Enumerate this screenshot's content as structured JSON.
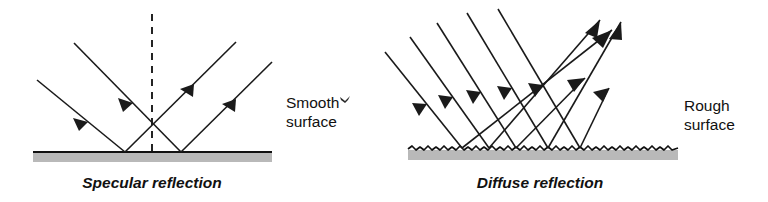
{
  "figure": {
    "background_color": "#ffffff",
    "ink_color": "#1a1a1a",
    "surface_fill_color": "#b9b9b9",
    "width": 768,
    "height": 202
  },
  "labels": {
    "smooth_line1": "Smooth",
    "smooth_line2": "surface",
    "rough_line1": "Rough",
    "rough_line2": "surface",
    "caption_left": "Specular reflection",
    "caption_right": "Diffuse reflection"
  },
  "panels": [
    {
      "id": "specular",
      "name": "specular-reflection-panel",
      "caption": "Specular reflection",
      "surface_label": "Smooth surface",
      "surface_type": "smooth",
      "surface": {
        "x1": 33,
        "x2": 272,
        "y": 152,
        "thickness": 9
      },
      "normal": {
        "x": 152,
        "y_top": 14,
        "y_bottom": 152,
        "style": "dashed"
      },
      "incident_rays": [
        {
          "x1": 74,
          "y1": 43,
          "x2": 181,
          "y2": 152,
          "arrow_t": 0.55
        },
        {
          "x1": 37,
          "y1": 80,
          "x2": 125,
          "y2": 152,
          "arrow_t": 0.55
        }
      ],
      "reflected_rays": [
        {
          "x1": 125,
          "y1": 152,
          "x2": 236,
          "y2": 42,
          "arrow_t": 0.55
        },
        {
          "x1": 181,
          "y1": 152,
          "x2": 272,
          "y2": 62,
          "arrow_t": 0.55
        }
      ],
      "crossing_point": {
        "x": 152,
        "y": 123
      }
    },
    {
      "id": "diffuse",
      "name": "diffuse-reflection-panel",
      "caption": "Diffuse reflection",
      "surface_label": "Rough surface",
      "surface_type": "rough",
      "surface": {
        "x1": 408,
        "x2": 678,
        "y": 149,
        "thickness": 9
      },
      "incident_rays": [
        {
          "x1": 410,
          "y1": 37,
          "x2": 489,
          "y2": 148,
          "arrow_t": 0.52
        },
        {
          "x1": 437,
          "y1": 23,
          "x2": 516,
          "y2": 148,
          "arrow_t": 0.52
        },
        {
          "x1": 467,
          "y1": 13,
          "x2": 548,
          "y2": 148,
          "arrow_t": 0.52
        },
        {
          "x1": 498,
          "y1": 9,
          "x2": 580,
          "y2": 148,
          "arrow_t": 0.52
        },
        {
          "x1": 385,
          "y1": 52,
          "x2": 462,
          "y2": 148,
          "arrow_t": 0.5
        }
      ],
      "reflected_rays": [
        {
          "x1": 462,
          "y1": 148,
          "x2": 612,
          "y2": 30,
          "arrow_t": 0.92
        },
        {
          "x1": 489,
          "y1": 148,
          "x2": 600,
          "y2": 20,
          "arrow_t": 0.93
        },
        {
          "x1": 548,
          "y1": 148,
          "x2": 621,
          "y2": 22,
          "arrow_t": 0.93
        },
        {
          "x1": 516,
          "y1": 148,
          "x2": 585,
          "y2": 78,
          "arrow_t": 0.92
        },
        {
          "x1": 580,
          "y1": 148,
          "x2": 609,
          "y2": 88,
          "arrow_t": 0.9
        }
      ]
    }
  ],
  "artifacts": [
    {
      "name": "scan-speck",
      "x": 344,
      "y": 97
    }
  ]
}
